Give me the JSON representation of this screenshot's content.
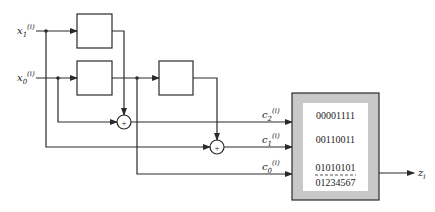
{
  "inputs": {
    "x1": {
      "base": "x",
      "sub": "1",
      "sup": "(i)"
    },
    "x0": {
      "base": "x",
      "sub": "0",
      "sup": "(i)"
    }
  },
  "signals": {
    "c2": {
      "base": "c",
      "sub": "2",
      "sup": "(i)"
    },
    "c1": {
      "base": "c",
      "sub": "1",
      "sup": "(i)"
    },
    "c0": {
      "base": "c",
      "sub": "0",
      "sup": "(i)"
    }
  },
  "output": {
    "base": "z",
    "sub": "i"
  },
  "adders": [
    {
      "symbol": "+"
    },
    {
      "symbol": "+"
    }
  ],
  "mux_table": {
    "rows": [
      "00001111",
      "00110011",
      "01010101"
    ],
    "separator": "--------",
    "index": "01234567"
  },
  "colors": {
    "line": "#2a2a2a",
    "mux_frame": "#c8c8c8",
    "mux_inner": "#ffffff"
  }
}
